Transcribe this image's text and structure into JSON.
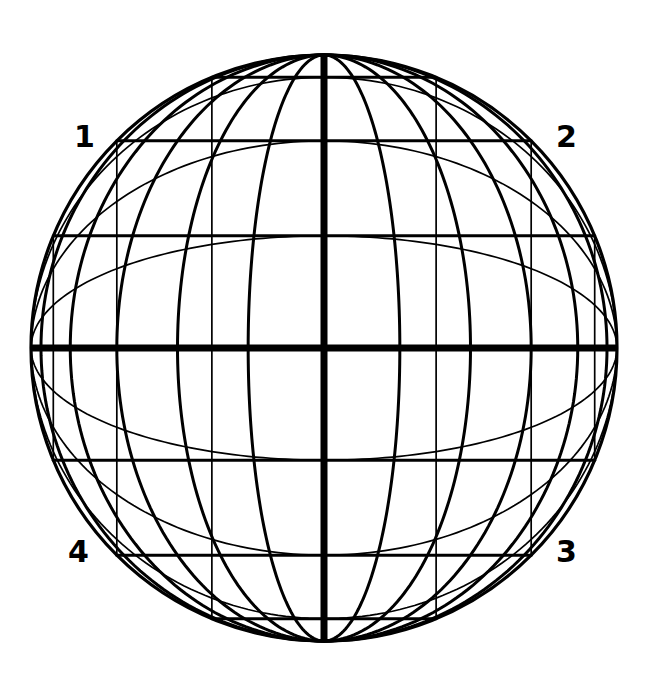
{
  "figure": {
    "background_color": "#ffffff",
    "line_color": "#000000"
  },
  "globe": {
    "center_x": 324,
    "center_y": 348,
    "radius": 293,
    "outline_width": 3.2,
    "axis_width": 7.0,
    "major_width": 3.0,
    "minor_width": 1.7
  },
  "labels": {
    "quadrant_1": "1",
    "quadrant_2": "2",
    "quadrant_3": "3",
    "quadrant_4": "4"
  },
  "chart_data": {
    "type": "line",
    "xlabel": "",
    "ylabel": "",
    "projection": "orthographic",
    "center_longitude": 0,
    "center_latitude": 0,
    "graticule_families": [
      {
        "name": "primary-graticule",
        "pole": "north-south",
        "parallels_deg": [
          -67.5,
          -45,
          -22.5,
          0,
          22.5,
          45,
          67.5
        ],
        "meridians_deg": [
          -75,
          -60,
          -45,
          -30,
          -15,
          0,
          15,
          30,
          45,
          60,
          75
        ],
        "equator_emphasis": true,
        "central_meridian_emphasis": true
      },
      {
        "name": "secondary-graticule",
        "pole": "east-west",
        "rotation_deg": 90,
        "parallels_deg": [
          -67.5,
          -45,
          -22.5,
          22.5,
          45,
          67.5
        ],
        "meridians_deg": [
          -67.5,
          -45,
          -22.5,
          0,
          22.5,
          45,
          67.5
        ]
      }
    ],
    "annotations": [
      {
        "text": "1",
        "position": "upper-left",
        "x": 88,
        "y": 137
      },
      {
        "text": "2",
        "position": "upper-right",
        "x": 570,
        "y": 137
      },
      {
        "text": "3",
        "position": "lower-right",
        "x": 570,
        "y": 552
      },
      {
        "text": "4",
        "position": "lower-left",
        "x": 82,
        "y": 552
      }
    ],
    "legend": "none",
    "grid": true
  }
}
